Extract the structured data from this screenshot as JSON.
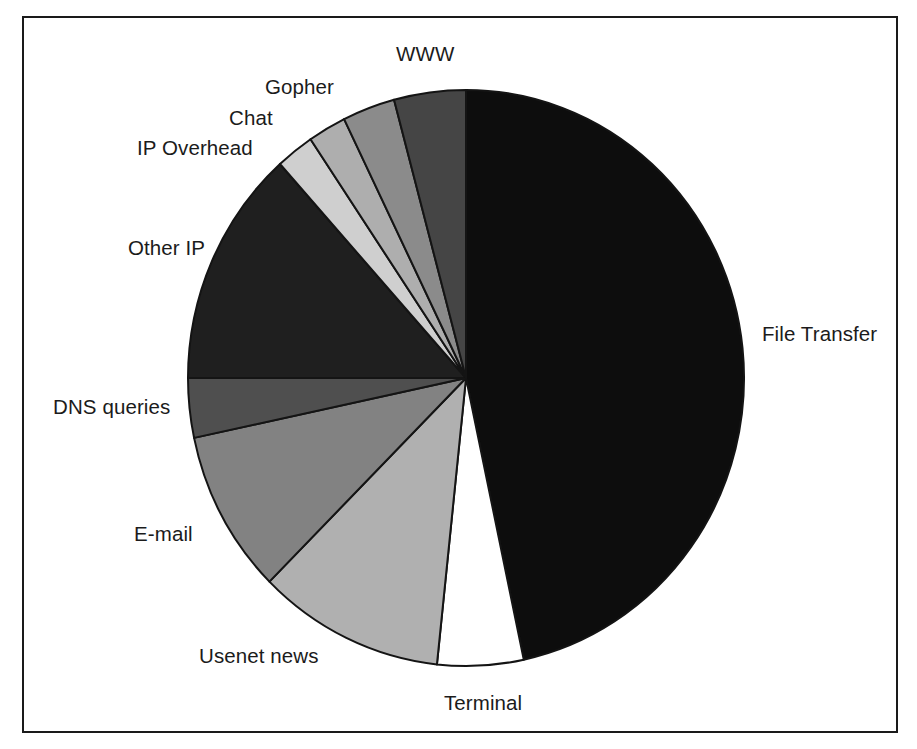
{
  "figure": {
    "frame_visible": true,
    "frame_color": "#1a1a1a",
    "background_color": "#ffffff",
    "label_color": "#1b1b1b"
  },
  "chart_data": {
    "type": "pie",
    "title": "",
    "subtitle": "",
    "xlabel": "",
    "ylabel": "",
    "legend_position": "none",
    "grid": false,
    "labels_placement": "outside-leaderless",
    "start_angle_deg": 0,
    "direction": "clockwise",
    "categories": [
      "File Transfer",
      "Terminal",
      "Usenet news",
      "E-mail",
      "DNS queries",
      "Other IP",
      "IP Overhead",
      "Chat",
      "Gopher",
      "WWW"
    ],
    "values": [
      46.7,
      5.0,
      10.8,
      9.2,
      3.3,
      13.3,
      2.2,
      2.2,
      3.1,
      4.2
    ],
    "slices": [
      {
        "label": "File Transfer",
        "value": 46.7,
        "start_deg": 0.0,
        "end_deg": 168.0,
        "color": "#0d0d0d"
      },
      {
        "label": "Terminal",
        "value": 5.0,
        "start_deg": 168.0,
        "end_deg": 186.0,
        "color": "#ffffff"
      },
      {
        "label": "Usenet news",
        "value": 10.8,
        "start_deg": 186.0,
        "end_deg": 225.0,
        "color": "#b0b0b0"
      },
      {
        "label": "E-mail",
        "value": 9.2,
        "start_deg": 225.0,
        "end_deg": 258.0,
        "color": "#828282"
      },
      {
        "label": "DNS queries",
        "value": 3.3,
        "start_deg": 258.0,
        "end_deg": 270.0,
        "color": "#4f4f4f"
      },
      {
        "label": "Other IP",
        "value": 13.3,
        "start_deg": 270.0,
        "end_deg": 318.0,
        "color": "#1f1f1f"
      },
      {
        "label": "IP Overhead",
        "value": 2.2,
        "start_deg": 318.0,
        "end_deg": 326.0,
        "color": "#cfcfcf"
      },
      {
        "label": "Chat",
        "value": 2.2,
        "start_deg": 326.0,
        "end_deg": 334.0,
        "color": "#aeaeae"
      },
      {
        "label": "Gopher",
        "value": 3.1,
        "start_deg": 334.0,
        "end_deg": 345.0,
        "color": "#8b8b8b"
      },
      {
        "label": "WWW",
        "value": 4.2,
        "start_deg": 345.0,
        "end_deg": 360.0,
        "color": "#454545"
      }
    ]
  },
  "labels": {
    "www": "WWW",
    "gopher": "Gopher",
    "chat": "Chat",
    "ip_overhead": "IP Overhead",
    "other_ip": "Other IP",
    "dns_queries": "DNS queries",
    "email": "E-mail",
    "usenet_news": "Usenet news",
    "terminal": "Terminal",
    "file_transfer": "File Transfer"
  }
}
